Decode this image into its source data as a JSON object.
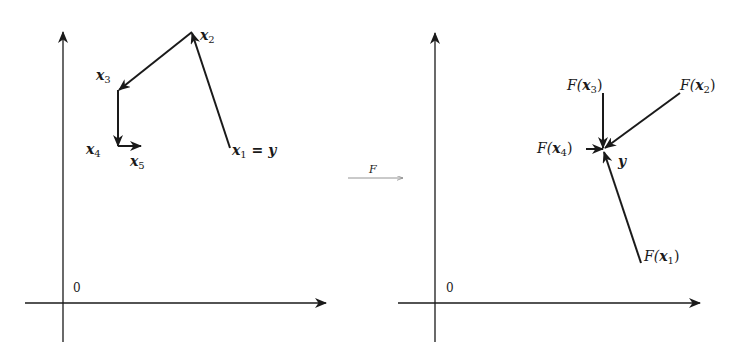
{
  "diagram": {
    "type": "fixed-point iteration illustration",
    "colors": {
      "ink": "#1a1a1a",
      "mapping_arrow": "#888888",
      "background": "#ffffff"
    },
    "left_panel": {
      "origin_label": "0",
      "points": [
        {
          "id": "x1",
          "base": "x",
          "sub": "1",
          "suffix": " = y",
          "xy": [
            230,
            148
          ]
        },
        {
          "id": "x2",
          "base": "x",
          "sub": "2",
          "xy": [
            192,
            32
          ]
        },
        {
          "id": "x3",
          "base": "x",
          "sub": "3",
          "xy": [
            118,
            90
          ]
        },
        {
          "id": "x4",
          "base": "x",
          "sub": "4",
          "xy": [
            118,
            146
          ]
        },
        {
          "id": "x5",
          "base": "x",
          "sub": "5",
          "xy": [
            140,
            146
          ]
        }
      ],
      "arrows": [
        {
          "from": "x1",
          "to": "x2"
        },
        {
          "from": "x2",
          "to": "x3"
        },
        {
          "from": "x3",
          "to": "x4"
        },
        {
          "from": "x4",
          "to": "x5"
        }
      ]
    },
    "mapping": {
      "label": "F"
    },
    "right_panel": {
      "origin_label": "0",
      "target": {
        "label": "y",
        "xy": [
          603,
          150
        ]
      },
      "points": [
        {
          "id": "Fx1",
          "label_prefix": "F(",
          "base": "x",
          "sub": "1",
          "label_suffix": ")",
          "xy": [
            641,
            263
          ]
        },
        {
          "id": "Fx2",
          "label_prefix": "F(",
          "base": "x",
          "sub": "2",
          "label_suffix": ")",
          "xy": [
            680,
            93
          ]
        },
        {
          "id": "Fx3",
          "label_prefix": "F(",
          "base": "x",
          "sub": "3",
          "label_suffix": ")",
          "xy": [
            603,
            93
          ]
        },
        {
          "id": "Fx4",
          "label_prefix": "F(",
          "base": "x",
          "sub": "4",
          "label_suffix": ")",
          "xy": [
            586,
            149
          ]
        }
      ]
    }
  }
}
